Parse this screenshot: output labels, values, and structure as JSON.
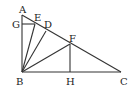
{
  "diagram": {
    "type": "geometry",
    "points": {
      "A": {
        "label": "A",
        "x": 22,
        "y": 15
      },
      "G": {
        "label": "G",
        "x": 22,
        "y": 24
      },
      "E": {
        "label": "E",
        "x": 35,
        "y": 24
      },
      "D": {
        "label": "D",
        "x": 46,
        "y": 31
      },
      "F": {
        "label": "F",
        "x": 70,
        "y": 44
      },
      "B": {
        "label": "B",
        "x": 22,
        "y": 72
      },
      "H": {
        "label": "H",
        "x": 70,
        "y": 72
      },
      "C": {
        "label": "C",
        "x": 121,
        "y": 72
      }
    },
    "segments": [
      "AB",
      "BC",
      "AC",
      "GE",
      "BE",
      "BD",
      "BF",
      "FH"
    ],
    "stroke_color": "#333333"
  }
}
